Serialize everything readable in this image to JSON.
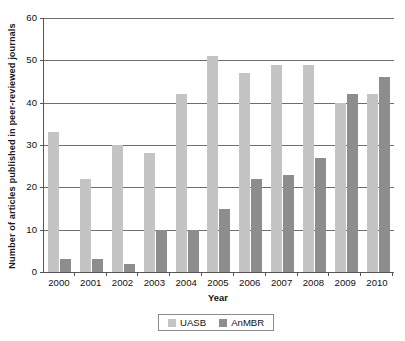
{
  "chart_data": {
    "type": "bar",
    "title": "",
    "xlabel": "Year",
    "ylabel": "Number of articles published in peer-reviewed journals",
    "categories": [
      "2000",
      "2001",
      "2002",
      "2003",
      "2004",
      "2005",
      "2006",
      "2007",
      "2008",
      "2009",
      "2010"
    ],
    "series": [
      {
        "name": "UASB",
        "color": "#c4c4c4",
        "values": [
          33,
          22,
          30,
          28,
          42,
          51,
          47,
          49,
          49,
          40,
          42
        ]
      },
      {
        "name": "AnMBR",
        "color": "#8d8d8d",
        "values": [
          3,
          3,
          2,
          10,
          10,
          15,
          22,
          23,
          27,
          42,
          46
        ]
      }
    ],
    "ylim": [
      0,
      60
    ],
    "yticks": [
      0,
      10,
      20,
      30,
      40,
      50,
      60
    ],
    "ytick_labels": [
      "0",
      "10",
      "20",
      "30",
      "40",
      "50",
      "60"
    ],
    "grid": true,
    "grid_axis": "y",
    "legend_position": "bottom-center"
  },
  "legend": {
    "items": [
      {
        "label": "UASB"
      },
      {
        "label": "AnMBR"
      }
    ]
  }
}
